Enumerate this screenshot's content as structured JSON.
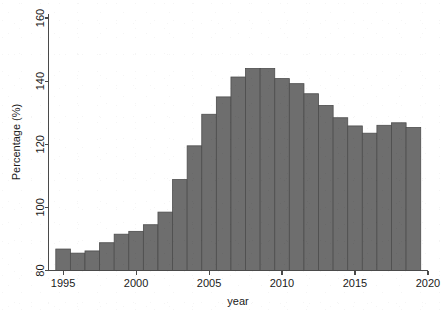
{
  "chart_data": {
    "type": "bar",
    "title": "",
    "subtitle": "",
    "xlabel": "year",
    "ylabel": "Percentage (%)",
    "xlim": [
      1994,
      2020
    ],
    "ylim": [
      80,
      160
    ],
    "grid": false,
    "legend": null,
    "bar_color": "#6e6e6e",
    "bar_edge_color": "#4d4d4d",
    "axis_color": "#4a4a4a",
    "background_color": "#ffffff",
    "xticks": [
      1995,
      2000,
      2005,
      2010,
      2015,
      2020
    ],
    "xtick_labels": [
      "1995",
      "2000",
      "2005",
      "2010",
      "2015",
      "2020"
    ],
    "yticks": [
      80,
      100,
      120,
      140,
      160
    ],
    "ytick_labels": [
      "80",
      "100",
      "120",
      "140",
      "160"
    ],
    "categories": [
      1995,
      1996,
      1997,
      1998,
      1999,
      2000,
      2001,
      2002,
      2003,
      2004,
      2005,
      2006,
      2007,
      2008,
      2009,
      2010,
      2011,
      2012,
      2013,
      2014,
      2015,
      2016,
      2017,
      2018,
      2019
    ],
    "values": [
      86.8,
      85.5,
      86.2,
      88.8,
      91.5,
      92.4,
      94.5,
      98.5,
      108.8,
      119.5,
      129.5,
      135.0,
      141.3,
      144.0,
      144.0,
      140.8,
      139.2,
      136.0,
      132.3,
      128.4,
      125.8,
      123.5,
      126.0,
      126.8,
      125.3
    ],
    "notes": {
      "series_label": "Percentage (%)",
      "bar_width_years": 1,
      "first_bar_left_edge": 1994.5,
      "last_bar_right_edge": 2019.5
    }
  },
  "axes": {
    "x_axis_name": "year-axis",
    "y_axis_name": "percentage-axis"
  }
}
